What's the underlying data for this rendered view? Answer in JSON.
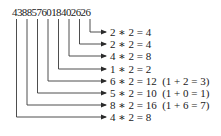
{
  "diagram": {
    "number": "4388576018402626",
    "lines_color": "#3a3a3a",
    "rows": [
      {
        "digit": "2",
        "label": "2 ∗ 2 = 4"
      },
      {
        "digit": "2",
        "label": "2 ∗ 2 = 4"
      },
      {
        "digit": "4",
        "label": "4 ∗ 2 = 8"
      },
      {
        "digit": "1",
        "label": "1 ∗ 2 = 2"
      },
      {
        "digit": "6",
        "label": "6 ∗ 2 = 12  (1 + 2 = 3)"
      },
      {
        "digit": "5",
        "label": "5 ∗ 2 = 10  (1 + 0 = 1)"
      },
      {
        "digit": "8",
        "label": "8 ∗ 2 = 16  (1 + 6 = 7)"
      },
      {
        "digit": "4",
        "label": "4 ∗ 2 = 8"
      }
    ]
  }
}
